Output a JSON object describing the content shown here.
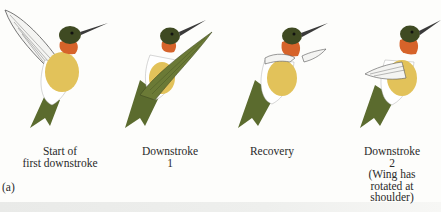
{
  "figure": {
    "label": "(a)",
    "colors": {
      "head": "#3f4a22",
      "throat": "#d6632a",
      "breast": "#e2c25a",
      "belly_white": "#ffffff",
      "back_green": "#5b6b2e",
      "wing_green": "#6b7a36",
      "wing_white": "#f4f4f2",
      "beak": "#3a3a3a",
      "background": "#fdfdfb"
    },
    "panels": [
      {
        "caption": "Start of\nfirst downstroke",
        "wing_state": "raised-white-wing"
      },
      {
        "caption": "Downstroke\n1",
        "wing_state": "green-wing-forward"
      },
      {
        "caption": "Recovery",
        "wing_state": "wing-folded-horizontal"
      },
      {
        "caption": "Downstroke\n2\n(Wing has\nrotated at\nshoulder)",
        "wing_state": "wing-rotated-down"
      }
    ]
  }
}
